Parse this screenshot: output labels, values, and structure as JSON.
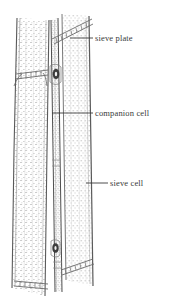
{
  "figure": {
    "style": "ink stipple line drawing",
    "background_color": "#ffffff",
    "ink_color": "#4a4a4a",
    "stipple_color": "#b9b9b9",
    "label_color": "#3a3a3a"
  },
  "labels": [
    {
      "id": "sieve-plate",
      "text": "sieve plate",
      "text_x": 95,
      "text_y": 33,
      "leader_x1": 70,
      "leader_y1": 38,
      "leader_x2": 93,
      "leader_y2": 38
    },
    {
      "id": "companion-cell",
      "text": "companion cell",
      "text_x": 95,
      "text_y": 108,
      "leader_x1": 52,
      "leader_y1": 113,
      "leader_x2": 93,
      "leader_y2": 113
    },
    {
      "id": "sieve-cell",
      "text": "sieve cell",
      "text_x": 110,
      "text_y": 178,
      "leader_x1": 86,
      "leader_y1": 183,
      "leader_x2": 108,
      "leader_y2": 183
    }
  ],
  "structures": {
    "left_sieve_cell": "tall narrow cell on the left side",
    "right_sieve_cell": "broad cell on the right side",
    "companion_cell": "slender strip between the two sieve cells",
    "sieve_plates": [
      {
        "id": "upper-diagonal",
        "orientation": "diagonal",
        "x1": 52,
        "y1": 38,
        "x2": 92,
        "y2": 18
      },
      {
        "id": "upper-horizontal-left",
        "orientation": "horizontal",
        "x1": 18,
        "y1": 72,
        "x2": 48,
        "y2": 72
      },
      {
        "id": "lower-diagonal",
        "orientation": "diagonal",
        "x1": 60,
        "y1": 268,
        "x2": 92,
        "y2": 258
      },
      {
        "id": "lower-horizontal-left",
        "orientation": "horizontal",
        "x1": 16,
        "y1": 282,
        "x2": 48,
        "y2": 282
      }
    ],
    "nuclei": [
      {
        "id": "upper-nucleus",
        "cx": 56,
        "cy": 74,
        "rx": 3,
        "ry": 5
      },
      {
        "id": "lower-nucleus",
        "cx": 55,
        "cy": 248,
        "rx": 3,
        "ry": 4.5
      }
    ]
  }
}
